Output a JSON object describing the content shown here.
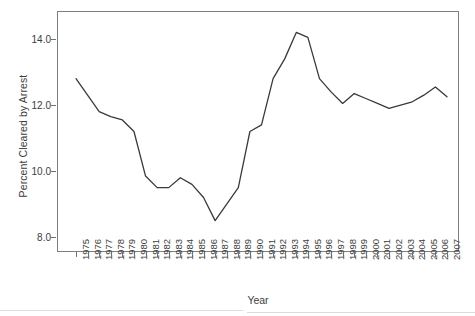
{
  "chart_data": {
    "type": "line",
    "title": "",
    "xlabel": "Year",
    "ylabel": "Percent Cleared by Arrest",
    "grid": false,
    "legend": false,
    "xlim": [
      1975,
      2007
    ],
    "ylim": [
      7.55,
      14.85
    ],
    "yticks": [
      8.0,
      10.0,
      12.0,
      14.0
    ],
    "ytick_labels": [
      "8.0",
      "10.0",
      "12.0",
      "14.0"
    ],
    "categories": [
      "1975",
      "1976",
      "1977",
      "1978",
      "1979",
      "1980",
      "1981",
      "1982",
      "1983",
      "1984",
      "1985",
      "1986",
      "1987",
      "1988",
      "1989",
      "1990",
      "1991",
      "1992",
      "1993",
      "1994",
      "1995",
      "1996",
      "1997",
      "1998",
      "1999",
      "2000",
      "2001",
      "2002",
      "2003",
      "2004",
      "2005",
      "2006",
      "2007"
    ],
    "values": [
      12.8,
      12.3,
      11.8,
      11.65,
      11.55,
      11.2,
      9.85,
      9.5,
      9.5,
      9.8,
      9.6,
      9.2,
      8.5,
      9.0,
      9.5,
      11.2,
      11.4,
      12.8,
      13.4,
      14.2,
      14.05,
      12.8,
      12.4,
      12.05,
      12.35,
      12.2,
      12.05,
      11.9,
      12.0,
      12.1,
      12.3,
      12.55,
      12.25
    ],
    "series_name": "Percent Cleared by Arrest",
    "line_color": "#3a3a3a",
    "line_width": 1.3,
    "axis_color": "#808080",
    "background": "#ffffff"
  },
  "axes": {
    "x_title": "Year",
    "y_title": "Percent Cleared by Arrest"
  }
}
